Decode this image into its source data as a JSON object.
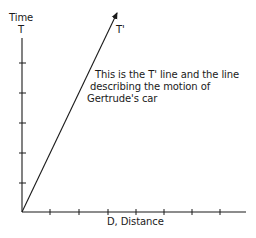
{
  "diagram": {
    "y_axis": {
      "title": "Time",
      "symbol": "T",
      "tick_count": 5
    },
    "x_axis": {
      "label": "D, Distance",
      "tick_count": 7
    },
    "line": {
      "label": "T'"
    },
    "annotation": {
      "lines": [
        "This is the T' line and the line",
        "describing the motion of",
        "Gertrude's car"
      ]
    },
    "colors": {
      "ink": "#1a1a1a",
      "background": "#ffffff"
    }
  }
}
